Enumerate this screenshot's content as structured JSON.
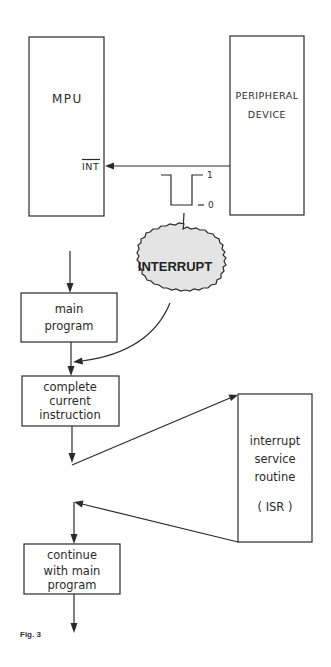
{
  "figure": {
    "caption": "Fig. 3"
  },
  "blocks": {
    "mpu": {
      "label": "MPU",
      "pin_label": "INT"
    },
    "peripheral": {
      "line1": "PERIPHERAL",
      "line2": "DEVICE"
    },
    "signal": {
      "high_label": "1",
      "low_label": "0"
    },
    "interrupt": {
      "label": "INTERRUPT"
    },
    "flow": {
      "main_program": {
        "line1": "main",
        "line2": "program"
      },
      "complete_instruction": {
        "line1": "complete",
        "line2": "current",
        "line3": "instruction"
      },
      "isr": {
        "line1": "interrupt",
        "line2": "service",
        "line3": "routine",
        "line4": "( ISR )"
      },
      "continue_main": {
        "line1": "continue",
        "line2": "with main",
        "line3": "program"
      }
    }
  },
  "colors": {
    "ink": "#2a2a2a",
    "cloud_fill": "#e4e4e4",
    "background": "#ffffff"
  }
}
